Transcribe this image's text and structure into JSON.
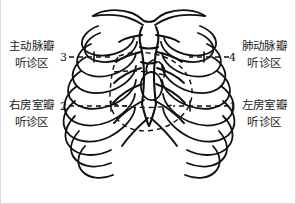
{
  "figure": {
    "type": "anatomical-line-drawing",
    "background_color": "#ffffff",
    "ink_color": "#111111",
    "frame_color": "#d8d8d8",
    "width": 296,
    "height": 204
  },
  "labels": [
    {
      "id": "aortic",
      "number": "3",
      "position": "top-left",
      "line1": "主动脉瓣",
      "line2": "听诊区"
    },
    {
      "id": "tricuspid",
      "number": "2",
      "position": "bottom-left",
      "line1": "右房室瓣",
      "line2": "听诊区"
    },
    {
      "id": "pulmonary",
      "number": "4",
      "position": "top-right",
      "line1": "肺动脉瓣",
      "line2": "听诊区"
    },
    {
      "id": "mitral",
      "number": "1",
      "position": "bottom-right",
      "line1": "左房室瓣",
      "line2": "听诊区"
    }
  ],
  "leaders": {
    "style": "dashed",
    "numbers": [
      "1",
      "2",
      "3",
      "4"
    ]
  }
}
